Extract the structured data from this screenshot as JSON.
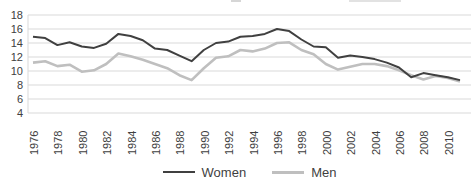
{
  "chart_data": {
    "type": "line",
    "title": "",
    "x": [
      1976,
      1977,
      1978,
      1979,
      1980,
      1981,
      1982,
      1983,
      1984,
      1985,
      1986,
      1987,
      1988,
      1989,
      1990,
      1991,
      1992,
      1993,
      1994,
      1995,
      1996,
      1997,
      1998,
      1999,
      2000,
      2001,
      2002,
      2003,
      2004,
      2005,
      2006,
      2007,
      2008,
      2009,
      2010,
      2011
    ],
    "x_tick_labels": [
      "1976",
      "1978",
      "1980",
      "1982",
      "1984",
      "1986",
      "1988",
      "1990",
      "1992",
      "1994",
      "1996",
      "1998",
      "2000",
      "2002",
      "2004",
      "2006",
      "2008",
      "2010"
    ],
    "y_ticks": [
      4,
      6,
      8,
      10,
      12,
      14,
      16,
      18
    ],
    "ylim": [
      4,
      18
    ],
    "xlabel": "",
    "ylabel": "",
    "grid": "horizontal",
    "legend_position": "bottom",
    "series": [
      {
        "name": "Women",
        "color": "#404040",
        "values": [
          14.9,
          14.7,
          13.7,
          14.1,
          13.5,
          13.3,
          13.9,
          15.3,
          15.0,
          14.4,
          13.2,
          13.0,
          12.2,
          11.4,
          13.0,
          14.0,
          14.2,
          14.9,
          15.0,
          15.3,
          16.0,
          15.7,
          14.5,
          13.5,
          13.4,
          11.9,
          12.2,
          12.0,
          11.7,
          11.2,
          10.5,
          9.1,
          9.7,
          9.4,
          9.1,
          8.7
        ]
      },
      {
        "name": "Men",
        "color": "#bfbfbf",
        "values": [
          11.2,
          11.4,
          10.7,
          10.9,
          9.9,
          10.1,
          11.0,
          12.5,
          12.1,
          11.6,
          11.0,
          10.4,
          9.4,
          8.7,
          10.4,
          11.9,
          12.1,
          13.0,
          12.8,
          13.2,
          14.0,
          14.1,
          13.0,
          12.4,
          11.0,
          10.2,
          10.6,
          11.0,
          11.0,
          10.7,
          10.1,
          9.4,
          8.8,
          9.3,
          9.0,
          8.5
        ]
      }
    ]
  },
  "colors": {
    "gridline": "#d9d9d9",
    "axis_line": "#d9d9d9",
    "axis_text": "#404040"
  }
}
